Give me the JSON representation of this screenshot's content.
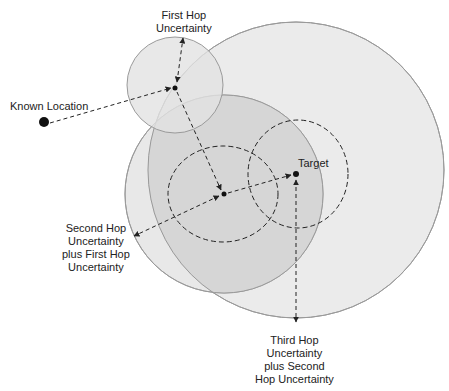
{
  "labels": {
    "known_location": "Known Location",
    "first_hop": [
      "First Hop",
      "Uncertainty"
    ],
    "target": "Target",
    "second_hop": [
      "Second Hop",
      "Uncertainty",
      "plus First Hop",
      "Uncertainty"
    ],
    "third_hop": [
      "Third Hop",
      "Uncertainty",
      "plus Second",
      "Hop Uncertainty"
    ]
  },
  "colors": {
    "fill_light": "#ebebeb",
    "fill_dark": "#dcdcdc",
    "circle_stroke": "#9a9a9a",
    "line": "#222222"
  },
  "points": {
    "known_location": [
      44,
      122
    ],
    "first_hop": [
      175,
      88
    ],
    "second_hop": [
      224,
      194
    ],
    "target": [
      296,
      174
    ]
  }
}
